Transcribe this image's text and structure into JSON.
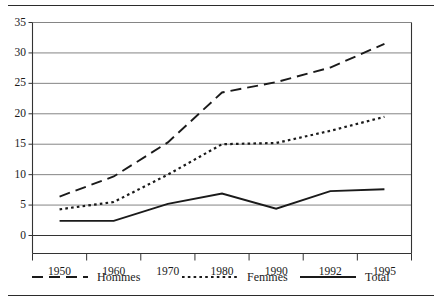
{
  "figure": {
    "has_top_rule": true,
    "has_bottom_rule": true,
    "ink_color": "#1a1a1a",
    "grid_color": "#777777",
    "axis_color": "#333333",
    "background": "#ffffff"
  },
  "chart_data": {
    "type": "line",
    "title": "",
    "subtitle": "",
    "xlabel": "",
    "ylabel": "",
    "categories": [
      "1950",
      "1960",
      "1970",
      "1980",
      "1990",
      "1992",
      "1995"
    ],
    "ylim": [
      0,
      35
    ],
    "yticks": [
      0,
      5,
      10,
      15,
      20,
      25,
      30,
      35
    ],
    "ytick_labels": [
      "0",
      "5",
      "10",
      "15",
      "20",
      "25",
      "30",
      "35"
    ],
    "xtick_labels": [
      "1950",
      "1960",
      "1970",
      "1980",
      "1990",
      "1992",
      "1995"
    ],
    "grid": "horizontal",
    "legend_position": "below",
    "series": [
      {
        "name": "Hommes",
        "style": "dashed",
        "color": "#1a1a1a",
        "values": [
          6.4,
          9.7,
          15.3,
          23.5,
          25.2,
          27.6,
          31.5
        ]
      },
      {
        "name": "Femmes",
        "style": "dotted",
        "color": "#1a1a1a",
        "values": [
          4.3,
          5.5,
          10.0,
          15.0,
          15.2,
          17.2,
          19.5
        ]
      },
      {
        "name": "Total",
        "style": "solid",
        "color": "#1a1a1a",
        "values": [
          2.4,
          2.4,
          5.2,
          6.9,
          4.4,
          7.3,
          7.6
        ]
      }
    ]
  },
  "legend": {
    "items": [
      {
        "label": "Hommes",
        "style": "dashed"
      },
      {
        "label": "Femmes",
        "style": "dotted"
      },
      {
        "label": "Total",
        "style": "solid"
      }
    ]
  }
}
